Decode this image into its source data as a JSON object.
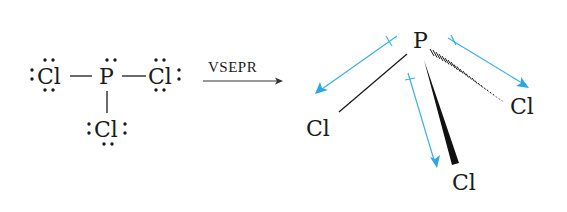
{
  "lewis_structure": {
    "central_atom": "P",
    "ligands": [
      "Cl",
      "Cl",
      "Cl"
    ],
    "lone_pair_symbol": ":"
  },
  "transform_arrow": {
    "label": "VSEPR"
  },
  "geometry": {
    "central_atom": "P",
    "ligand_left": "Cl",
    "ligand_right": "Cl",
    "ligand_bottom": "Cl",
    "colors": {
      "bond": "#1a1a1a",
      "dipole_arrow": "#3ab0e6"
    }
  }
}
